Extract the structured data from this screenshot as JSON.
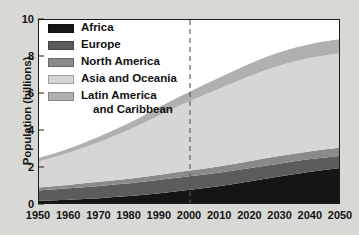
{
  "chart_data": {
    "type": "area",
    "stacked": true,
    "title": "",
    "xlabel": "",
    "ylabel": "Population (billions)",
    "xlim": [
      1950,
      2050
    ],
    "ylim": [
      0,
      10
    ],
    "grid": false,
    "legend_position": "top-left",
    "x": [
      1950,
      1960,
      1970,
      1980,
      1990,
      2000,
      2010,
      2020,
      2030,
      2040,
      2050
    ],
    "xticks": [
      "1950",
      "1960",
      "1970",
      "1980",
      "1990",
      "2000",
      "2010",
      "2020",
      "2030",
      "2040",
      "2050"
    ],
    "yticks": [
      "0",
      "2",
      "4",
      "6",
      "8",
      "10"
    ],
    "ytick_values": [
      0,
      2,
      4,
      6,
      8,
      10
    ],
    "series": [
      {
        "name": "Africa",
        "color": "#151515",
        "values": [
          0.23,
          0.29,
          0.37,
          0.48,
          0.64,
          0.82,
          1.03,
          1.28,
          1.55,
          1.8,
          2.0
        ]
      },
      {
        "name": "Europe",
        "color": "#5c5c5c",
        "values": [
          0.55,
          0.61,
          0.66,
          0.69,
          0.72,
          0.73,
          0.73,
          0.72,
          0.7,
          0.68,
          0.66
        ]
      },
      {
        "name": "North America",
        "color": "#8a8a8a",
        "values": [
          0.17,
          0.2,
          0.23,
          0.25,
          0.28,
          0.31,
          0.34,
          0.38,
          0.41,
          0.43,
          0.45
        ]
      },
      {
        "name": "Asia and Oceania",
        "color": "#d6d6d6",
        "values": [
          1.42,
          1.73,
          2.15,
          2.66,
          3.23,
          3.76,
          4.21,
          4.61,
          4.9,
          5.05,
          5.1
        ]
      },
      {
        "name": "Latin America and Caribbean",
        "color": "#b0b0b0",
        "values": [
          0.17,
          0.22,
          0.29,
          0.36,
          0.44,
          0.52,
          0.59,
          0.66,
          0.71,
          0.74,
          0.76
        ]
      }
    ],
    "totals": [
      2.54,
      3.05,
      3.7,
      4.44,
      5.31,
      6.14,
      6.9,
      7.65,
      8.27,
      8.7,
      8.97
    ],
    "annotations": [
      {
        "type": "vertical-dashed-line",
        "x": 2000,
        "label": "",
        "color": "#555555",
        "note": "divides historical data from projection"
      }
    ]
  },
  "legend": {
    "items": [
      {
        "label": "Africa",
        "label2": "",
        "color": "#151515"
      },
      {
        "label": "Europe",
        "label2": "",
        "color": "#5c5c5c"
      },
      {
        "label": "North America",
        "label2": "",
        "color": "#8a8a8a"
      },
      {
        "label": "Asia and Oceania",
        "label2": "",
        "color": "#d6d6d6"
      },
      {
        "label": "Latin America",
        "label2": "and Caribbean",
        "color": "#b0b0b0"
      }
    ]
  },
  "axis": {
    "y_title": "Population (billions)"
  },
  "colors": {
    "background": "#d8d8d4",
    "plot_background": "#ffffff",
    "axis": "#1c1c1c",
    "text": "#121212"
  }
}
